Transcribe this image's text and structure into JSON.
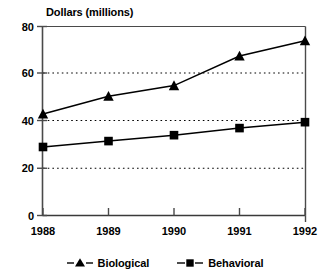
{
  "chart_data": {
    "type": "line",
    "title": "Dollars (millions)",
    "xlabel": "",
    "ylabel": "",
    "categories": [
      "1988",
      "1989",
      "1990",
      "1991",
      "1992"
    ],
    "series": [
      {
        "name": "Biological",
        "marker": "triangle",
        "values": [
          43,
          50.5,
          55,
          67.5,
          74
        ]
      },
      {
        "name": "Behavioral",
        "marker": "square",
        "values": [
          29,
          31.5,
          34,
          37,
          39.5
        ]
      }
    ],
    "ylim": [
      0,
      80
    ],
    "yticks": [
      0,
      20,
      40,
      60,
      80
    ],
    "ytick_labels": [
      "0",
      "20",
      "40",
      "60",
      "80"
    ],
    "xtick_labels": [
      "1988",
      "1989",
      "1990",
      "1991",
      "1992"
    ],
    "grid": "horizontal-dotted",
    "gridlines_at": [
      20,
      40,
      60
    ],
    "legend_position": "bottom",
    "line_color": "#000000",
    "background_color": "#ffffff"
  },
  "legend": {
    "entries": [
      {
        "label": "Biological"
      },
      {
        "label": "Behavioral"
      }
    ]
  },
  "axis": {
    "y_labels": [
      "80",
      "60",
      "40",
      "20",
      "0"
    ],
    "x_labels": [
      "1988",
      "1989",
      "1990",
      "1991",
      "1992"
    ]
  }
}
